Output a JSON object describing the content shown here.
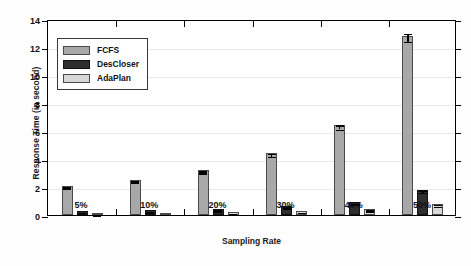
{
  "chart_data": {
    "type": "bar",
    "title": "",
    "xlabel": "Sampling Rate",
    "ylabel": "Response Time (in second)",
    "categories": [
      "5%",
      "10%",
      "20%",
      "30%",
      "40%",
      "50%"
    ],
    "series": [
      {
        "name": "FCFS",
        "color": "#a8a8a8",
        "values": [
          2.1,
          2.5,
          3.2,
          4.4,
          6.4,
          12.8
        ],
        "errors": [
          0.05,
          0.05,
          0.07,
          0.1,
          0.15,
          0.3
        ]
      },
      {
        "name": "DesCloser",
        "color": "#2e2e2e",
        "values": [
          0.3,
          0.35,
          0.45,
          0.65,
          0.9,
          1.8
        ],
        "errors": [
          0.02,
          0.02,
          0.03,
          0.04,
          0.05,
          0.08
        ]
      },
      {
        "name": "AdaPlan",
        "color": "#d8d8d8",
        "values": [
          0.1,
          0.15,
          0.2,
          0.3,
          0.45,
          0.8
        ],
        "errors": [
          0.01,
          0.01,
          0.02,
          0.02,
          0.03,
          0.05
        ]
      }
    ],
    "ylim": [
      0,
      14
    ],
    "yticks": [
      0,
      2,
      4,
      6,
      8,
      10,
      12,
      14
    ],
    "ytick_labels": [
      "0",
      "2",
      "4",
      "6",
      "8",
      "10",
      "12",
      "14"
    ],
    "grid": true,
    "legend_position": "upper-left"
  },
  "legend": {
    "items": [
      {
        "label": "FCFS"
      },
      {
        "label": "DesCloser"
      },
      {
        "label": "AdaPlan"
      }
    ]
  },
  "axes": {
    "y_title": "Response Time (in second)",
    "x_title": "Sampling Rate"
  }
}
